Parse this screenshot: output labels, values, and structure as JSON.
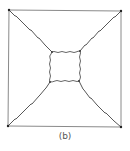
{
  "figure": {
    "caption": "(b)",
    "outer_square": {
      "corners": [
        [
          9,
          10
        ],
        [
          121,
          11
        ],
        [
          121,
          127
        ],
        [
          8,
          126
        ]
      ],
      "stroke": "#8a8a8a"
    },
    "inner_square": {
      "corners": [
        [
          52,
          52
        ],
        [
          80,
          51
        ],
        [
          79,
          81
        ],
        [
          50,
          82
        ]
      ],
      "stroke": "#555555",
      "style": "wavy"
    },
    "connectors": [
      {
        "from": [
          9,
          10
        ],
        "to": [
          52,
          52
        ]
      },
      {
        "from": [
          121,
          11
        ],
        "to": [
          80,
          51
        ]
      },
      {
        "from": [
          121,
          127
        ],
        "to": [
          79,
          81
        ]
      },
      {
        "from": [
          8,
          126
        ],
        "to": [
          50,
          82
        ]
      }
    ],
    "connector_stroke": "#444444",
    "corner_dot_color": "#222222"
  }
}
